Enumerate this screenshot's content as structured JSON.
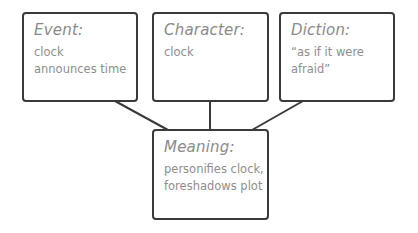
{
  "diagram": {
    "colors": {
      "border": "#3a3a3a",
      "text": "#8a8a8a",
      "background": "#ffffff"
    },
    "boxes": {
      "event": {
        "title": "Event:",
        "lines": [
          "clock",
          "announces time"
        ]
      },
      "character": {
        "title": "Character:",
        "lines": [
          "clock"
        ]
      },
      "diction": {
        "title": "Diction:",
        "lines": [
          "“as if it were",
          "afraid”"
        ]
      },
      "meaning": {
        "title": "Meaning:",
        "lines": [
          "personifies clock,",
          "foreshadows plot"
        ]
      }
    },
    "connections": [
      {
        "from": "event",
        "to": "meaning"
      },
      {
        "from": "character",
        "to": "meaning"
      },
      {
        "from": "diction",
        "to": "meaning"
      }
    ]
  }
}
